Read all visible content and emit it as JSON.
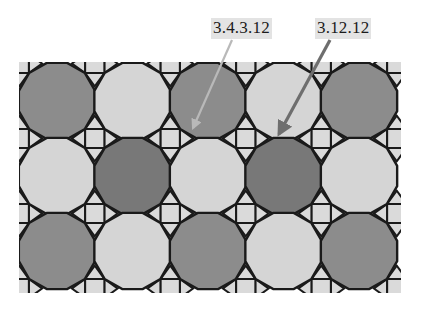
{
  "figure": {
    "title_present": false,
    "background_color": "#ffffff",
    "outline_color": "#1a1a1a",
    "width": 430,
    "height": 312
  },
  "labels": [
    {
      "id": "label-3-4-3-12",
      "name": "vertex-figure-label-3-4-3-12",
      "text": "3.4.3.12",
      "x": 211,
      "y": 18,
      "highlight_color": "#e3e3e3",
      "text_color": "#1b1b1b"
    },
    {
      "id": "label-3-12-12",
      "name": "vertex-figure-label-3-12-12",
      "text": "3.12.12",
      "x": 315,
      "y": 18,
      "highlight_color": "#e3e3e3",
      "text_color": "#1b1b1b"
    }
  ],
  "leaders": [
    {
      "id": "leader-3-4-3-12",
      "name": "leader-line-3-4-3-12",
      "from_x": 232,
      "from_y": 40,
      "to_x": 193,
      "to_y": 128,
      "color": "#b9b9b9",
      "width": 2.2,
      "arrowhead": true,
      "points_to": "triangle-square-junction-region"
    },
    {
      "id": "leader-3-12-12",
      "name": "leader-line-3-12-12",
      "from_x": 330,
      "from_y": 40,
      "to_x": 279,
      "to_y": 134,
      "color": "#6e6e6e",
      "width": 3.2,
      "arrowhead": true,
      "points_to": "dodecagon-dodecagon-triangle-vertex"
    }
  ],
  "tiling": {
    "name": "3.4.3.12-and-3.12.12-semiregular-tiling",
    "origin_x": 57,
    "origin_y": 101,
    "cell_pitch_x": 75.5,
    "cell_pitch_y": 75.0,
    "dodecagon_circumradius": 39.5,
    "square_half_size": 9.6,
    "columns": 5,
    "rows": 3,
    "palette": {
      "light": "#d5d5d5",
      "medium": "#8c8c8c",
      "dark": "#787878",
      "square_fill": "#dadada",
      "triangle_light": "#d5d5d5",
      "triangle_medium": "#8c8c8c",
      "triangle_dark": "#787878",
      "stroke": "#1a1a1a"
    },
    "dodecagon_color_grid": [
      [
        "medium",
        "light",
        "medium",
        "light",
        "medium"
      ],
      [
        "light",
        "dark",
        "light",
        "dark",
        "light"
      ],
      [
        "medium",
        "light",
        "medium",
        "light",
        "medium"
      ]
    ],
    "clip": {
      "x": 19,
      "y": 62,
      "width": 382,
      "height": 231
    }
  }
}
